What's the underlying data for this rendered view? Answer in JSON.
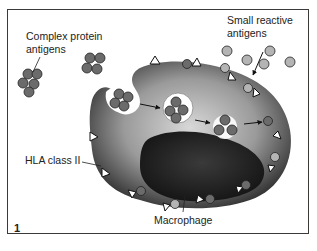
{
  "figure": {
    "number": "1",
    "labels": {
      "complex_antigens_line1": "Complex protein",
      "complex_antigens_line2": "antigens",
      "small_antigens_line1": "Small reactive",
      "small_antigens_line2": "antigens",
      "hla": "HLA class II",
      "macrophage": "Macrophage"
    },
    "colors": {
      "frame": "#3a3a3a",
      "complex_antigen": "#6b6b6b",
      "small_antigen": "#b0b0b0",
      "cell_body": "#8a8a8a",
      "nucleus": "#2a2a2a"
    }
  }
}
